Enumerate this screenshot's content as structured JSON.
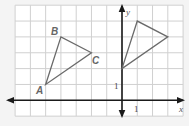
{
  "diagram": {
    "type": "coordinate-grid",
    "grid": {
      "x_min": -7,
      "x_max": 4,
      "y_min": -1,
      "y_max": 6
    },
    "axes": {
      "x_label": "x",
      "y_label": "y",
      "x_tick_label": "1",
      "y_tick_label": "1"
    },
    "triangle_abc": {
      "vertices": [
        {
          "label": "A",
          "x": -5,
          "y": 1
        },
        {
          "label": "B",
          "x": -4,
          "y": 4
        },
        {
          "label": "C",
          "x": -2,
          "y": 3
        }
      ]
    },
    "triangle_image": {
      "vertices": [
        {
          "x": 0,
          "y": 2
        },
        {
          "x": 1,
          "y": 5
        },
        {
          "x": 3,
          "y": 4
        }
      ]
    },
    "colors": {
      "grid": "#d0d0d0",
      "axes": "#1a1a1a",
      "triangles": "#6a6a6a",
      "background": "#f4f4f4"
    }
  }
}
